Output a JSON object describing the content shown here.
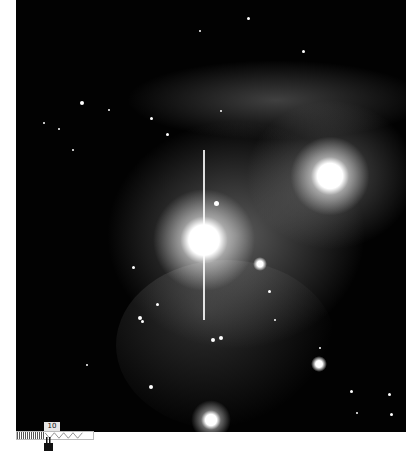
{
  "image": {
    "subject": "nebula-starfield",
    "background_color": "#020202",
    "nebula_color": "#cfcfcf"
  },
  "scale_bar": {
    "label": "10"
  },
  "bright_stars": [
    {
      "x": 204,
      "y": 240,
      "r": 24
    },
    {
      "x": 330,
      "y": 176,
      "r": 18
    },
    {
      "x": 206,
      "y": 420,
      "r": 10
    },
    {
      "x": 319,
      "y": 364,
      "r": 5
    }
  ]
}
